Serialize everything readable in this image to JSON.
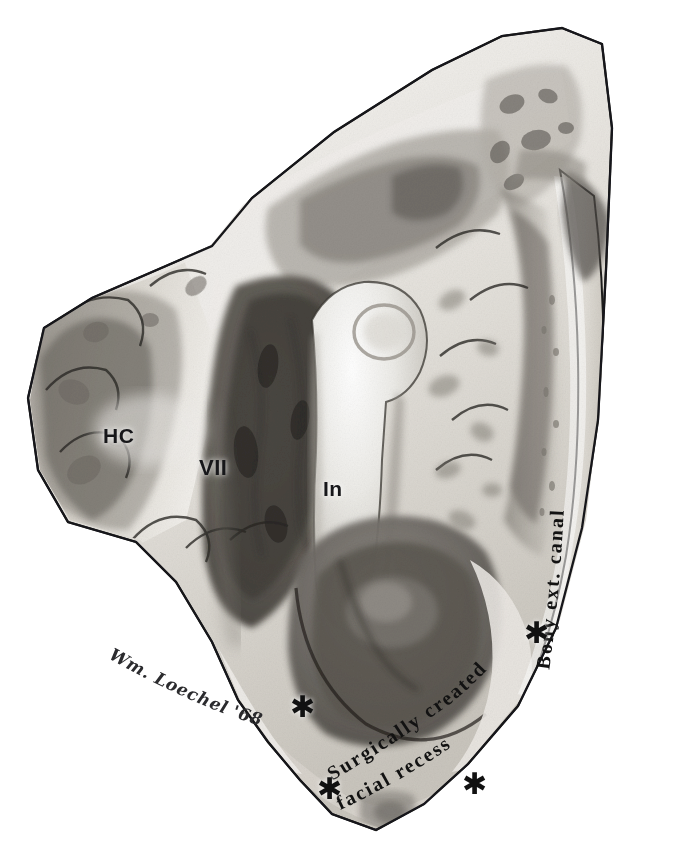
{
  "illustration": {
    "title": "Temporal bone dissection — surgically created facial recess",
    "medium": "graphite pencil anatomical illustration",
    "background_color": "#ffffff",
    "ink_color": "#121212",
    "bone_light": "#f2f0ec",
    "bone_mid": "#b9b5ae",
    "bone_dark": "#6e6a64",
    "cavity_dark": "#4a4641"
  },
  "labels": {
    "horizontal_canal": "HC",
    "facial_nerve": "VII",
    "incus": "In",
    "bony_ext_canal": "Bony ext. canal",
    "facial_recess_line1": "Surgically created",
    "facial_recess_line2": "facial recess"
  },
  "markers": {
    "asterisk_glyph": "✱",
    "count": 4,
    "positions": [
      {
        "id": "asterisk-upper-left",
        "x": 290,
        "y": 692
      },
      {
        "id": "asterisk-upper-right",
        "x": 524,
        "y": 618
      },
      {
        "id": "asterisk-lower-left",
        "x": 317,
        "y": 774
      },
      {
        "id": "asterisk-lower-right",
        "x": 462,
        "y": 769
      }
    ]
  },
  "signature": {
    "artist": "Wm. Loechel",
    "year": "'68",
    "full": "Wm. Loechel '68"
  }
}
